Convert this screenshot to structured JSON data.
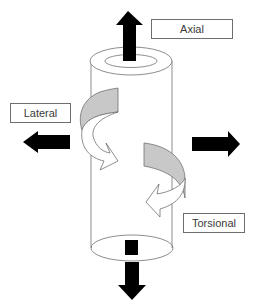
{
  "diagram": {
    "labels": {
      "axial": "Axial",
      "lateral": "Lateral",
      "torsional": "Torsional"
    },
    "colors": {
      "arrow_fill": "#000000",
      "band_shaded": "#c8c8c8",
      "outline": "#707070",
      "label_border": "#6e6e6e",
      "label_text": "#3a3a3a"
    },
    "elements": [
      "cylinder-tube",
      "axial-arrow-up",
      "axial-arrow-down",
      "lateral-arrow-left",
      "lateral-arrow-right",
      "lateral-bending-curved-arrow",
      "torsional-curved-arrow"
    ]
  }
}
